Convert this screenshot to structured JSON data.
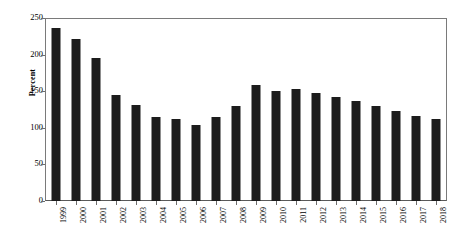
{
  "chart_data": {
    "type": "bar",
    "title": "",
    "xlabel": "",
    "ylabel": "Percent",
    "ylim": [
      0,
      250
    ],
    "yticks": [
      0,
      50,
      100,
      150,
      200,
      250
    ],
    "grid": false,
    "legend": null,
    "bar_color": "#1c1c1c",
    "categories": [
      "1999",
      "2000",
      "2001",
      "2002",
      "2003",
      "2004",
      "2005",
      "2006",
      "2007",
      "2008",
      "2009",
      "2010",
      "2011",
      "2012",
      "2013",
      "2014",
      "2015",
      "2016",
      "2017",
      "2018"
    ],
    "values": [
      237,
      222,
      196,
      146,
      132,
      115,
      113,
      105,
      116,
      131,
      159,
      151,
      154,
      148,
      143,
      137,
      131,
      123,
      117,
      113
    ]
  },
  "axes": {
    "y_title": "Percent"
  }
}
